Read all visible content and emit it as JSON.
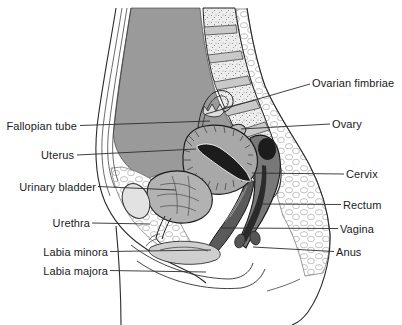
{
  "diagram": {
    "kind": "anatomy-sagittal-section",
    "labels": {
      "left": [
        {
          "id": "fallopian-tube",
          "text": "Fallopian tube"
        },
        {
          "id": "uterus",
          "text": "Uterus"
        },
        {
          "id": "urinary-bladder",
          "text": "Urinary bladder"
        },
        {
          "id": "urethra",
          "text": "Urethra"
        },
        {
          "id": "labia-minora",
          "text": "Labia minora"
        },
        {
          "id": "labia-majora",
          "text": "Labia majora"
        }
      ],
      "right": [
        {
          "id": "ovarian-fimbriae",
          "text": "Ovarian fimbriae"
        },
        {
          "id": "ovary",
          "text": "Ovary"
        },
        {
          "id": "cervix",
          "text": "Cervix"
        },
        {
          "id": "rectum",
          "text": "Rectum"
        },
        {
          "id": "vagina",
          "text": "Vagina"
        },
        {
          "id": "anus",
          "text": "Anus"
        }
      ]
    },
    "colors": {
      "outline": "#2a2a2a",
      "cavity_gray": "#9a9a9a",
      "organ_gray": "#a8a8a8",
      "lumen_dark": "#1c1c1c",
      "bone_light": "#ededed",
      "disc_gray": "#c9c9c9",
      "rectum_gray": "#787878",
      "bladder_gray": "#b2b2b2",
      "label_text": "#1a1a1a"
    }
  }
}
